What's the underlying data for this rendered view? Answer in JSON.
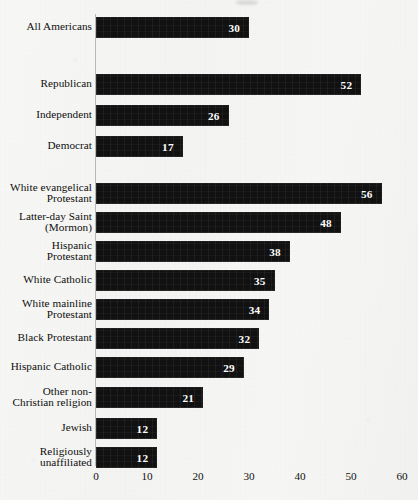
{
  "chart_data": {
    "type": "bar",
    "orientation": "horizontal",
    "title": "",
    "subtitle": "",
    "xlabel": "",
    "ylabel": "",
    "xlim": [
      0,
      60
    ],
    "x_ticks": [
      0,
      10,
      20,
      30,
      40,
      50,
      60
    ],
    "grid": false,
    "legend": false,
    "bar_color": "#111111",
    "value_label_color": "#ffffff",
    "axis_color": "#b9b9b4",
    "background_color": "#f4f4f2",
    "groups": [
      {
        "name": "overall",
        "categories": [
          "All Americans"
        ],
        "values": [
          30
        ]
      },
      {
        "name": "party",
        "categories": [
          "Republican",
          "Independent",
          "Democrat"
        ],
        "values": [
          52,
          26,
          17
        ]
      },
      {
        "name": "religion",
        "categories": [
          "White evangelical Protestant",
          "Latter-day Saint (Mormon)",
          "Hispanic Protestant",
          "White Catholic",
          "White mainline Protestant",
          "Black Protestant",
          "Hispanic Catholic",
          "Other non-Christian religion",
          "Jewish",
          "Religiously unaffiliated"
        ],
        "values": [
          56,
          48,
          38,
          35,
          34,
          32,
          29,
          21,
          12,
          12
        ]
      }
    ],
    "categories": [
      "All Americans",
      "Republican",
      "Independent",
      "Democrat",
      "White evangelical Protestant",
      "Latter-day Saint (Mormon)",
      "Hispanic Protestant",
      "White Catholic",
      "White mainline Protestant",
      "Black Protestant",
      "Hispanic Catholic",
      "Other non-Christian religion",
      "Jewish",
      "Religiously unaffiliated"
    ],
    "values": [
      30,
      52,
      26,
      17,
      56,
      48,
      38,
      35,
      34,
      32,
      29,
      21,
      12,
      12
    ]
  },
  "rows": [
    {
      "label_lines": [
        "All Americans"
      ],
      "value": 30,
      "value_text": "30",
      "top": 17
    },
    {
      "label_lines": [
        "Republican"
      ],
      "value": 52,
      "value_text": "52",
      "top": 74
    },
    {
      "label_lines": [
        "Independent"
      ],
      "value": 26,
      "value_text": "26",
      "top": 105
    },
    {
      "label_lines": [
        "Democrat"
      ],
      "value": 17,
      "value_text": "17",
      "top": 136
    },
    {
      "label_lines": [
        "White evangelical",
        "Protestant"
      ],
      "value": 56,
      "value_text": "56",
      "top": 183
    },
    {
      "label_lines": [
        "Latter-day Saint",
        "(Mormon)"
      ],
      "value": 48,
      "value_text": "48",
      "top": 212
    },
    {
      "label_lines": [
        "Hispanic",
        "Protestant"
      ],
      "value": 38,
      "value_text": "38",
      "top": 241
    },
    {
      "label_lines": [
        "White Catholic"
      ],
      "value": 35,
      "value_text": "35",
      "top": 270
    },
    {
      "label_lines": [
        "White mainline",
        "Protestant"
      ],
      "value": 34,
      "value_text": "34",
      "top": 299
    },
    {
      "label_lines": [
        "Black Protestant"
      ],
      "value": 32,
      "value_text": "32",
      "top": 328
    },
    {
      "label_lines": [
        "Hispanic Catholic"
      ],
      "value": 29,
      "value_text": "29",
      "top": 357
    },
    {
      "label_lines": [
        "Other non-",
        "Christian religion"
      ],
      "value": 21,
      "value_text": "21",
      "top": 387
    },
    {
      "label_lines": [
        "Jewish"
      ],
      "value": 12,
      "value_text": "12",
      "top": 418
    },
    {
      "label_lines": [
        "Religiously",
        "unaffiliated"
      ],
      "value": 12,
      "value_text": "12",
      "top": 447
    }
  ],
  "x_axis": {
    "ticks": [
      {
        "label": "0",
        "value": 0
      },
      {
        "label": "10",
        "value": 10
      },
      {
        "label": "20",
        "value": 20
      },
      {
        "label": "30",
        "value": 30
      },
      {
        "label": "40",
        "value": 40
      },
      {
        "label": "50",
        "value": 50
      },
      {
        "label": "60",
        "value": 60
      }
    ]
  },
  "scale": {
    "origin_px": 96,
    "px_per_unit": 5.1
  }
}
